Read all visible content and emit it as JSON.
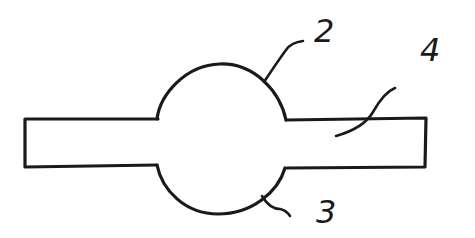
{
  "diagram": {
    "type": "patent-figure",
    "stroke_color": "#1a1a1a",
    "background": "#ffffff",
    "labels": [
      {
        "id": "2",
        "text": "2",
        "refers_to": "upper bulge"
      },
      {
        "id": "3",
        "text": "3",
        "refers_to": "lower bulge"
      },
      {
        "id": "4",
        "text": "4",
        "refers_to": "tube body"
      }
    ]
  }
}
